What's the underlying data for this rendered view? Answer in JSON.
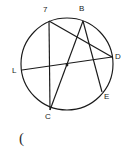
{
  "figure": {
    "kind": "circle-with-chords-diagram",
    "stroke_color": "#1a1a1a",
    "background_color": "#ffffff",
    "circle": {
      "cx": 67,
      "cy": 64,
      "r": 46
    },
    "points": [
      {
        "id": "A",
        "label": "7",
        "x": 49,
        "y": 21,
        "label_x": 43,
        "label_y": 6
      },
      {
        "id": "B",
        "label": "B",
        "x": 83,
        "y": 21,
        "label_x": 79,
        "label_y": 5
      },
      {
        "id": "D",
        "label": "D",
        "x": 112,
        "y": 57,
        "label_x": 115,
        "label_y": 53
      },
      {
        "id": "E",
        "label": "E",
        "x": 102,
        "y": 92,
        "label_x": 104,
        "label_y": 93
      },
      {
        "id": "C",
        "label": "C",
        "x": 50,
        "y": 110,
        "label_x": 45,
        "label_y": 113
      },
      {
        "id": "L",
        "label": "L",
        "x": 22,
        "y": 70,
        "label_x": 12,
        "label_y": 67
      }
    ],
    "chords": [
      {
        "id": "chord-A-C",
        "from": "A",
        "to": "C"
      },
      {
        "id": "chord-L-D",
        "from": "L",
        "to": "D"
      },
      {
        "id": "chord-A-D",
        "from": "A",
        "to": "D"
      },
      {
        "id": "chord-B-C",
        "from": "B",
        "to": "C"
      },
      {
        "id": "chord-B-E",
        "from": "B",
        "to": "E"
      }
    ],
    "intersection_dot": {
      "id": "center-intersection",
      "x": 67,
      "y": 65,
      "r": 1.4
    },
    "caption": "("
  }
}
